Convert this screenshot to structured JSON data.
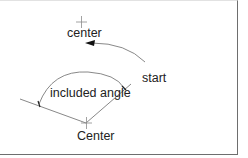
{
  "diagram": {
    "type": "arc-by-start-center-angle",
    "labels": {
      "top_center": "center",
      "start": "start",
      "included_angle": "included angle",
      "bottom_center": "Center"
    },
    "colors": {
      "line": "#7a7a7a",
      "text": "#222222",
      "arrow": "#111111",
      "frame": "#6e6e6e"
    }
  }
}
